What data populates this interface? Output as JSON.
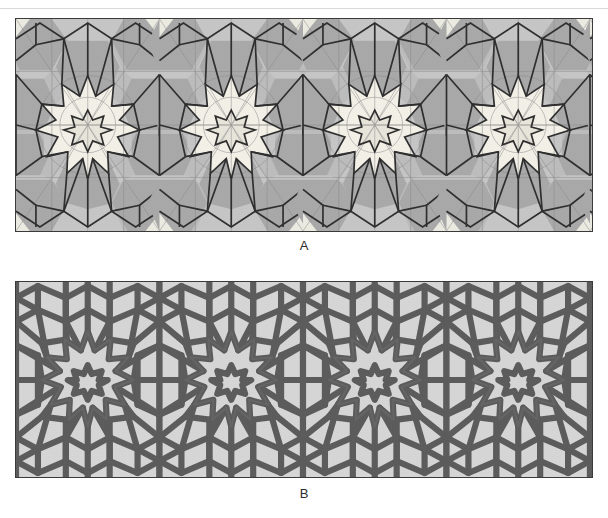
{
  "figure": {
    "background_color": "#ffffff",
    "top_cut_text": "",
    "panels": [
      {
        "id": "A",
        "label": "A",
        "caption": "A",
        "description": "Underlying polygonal tiling with construction lines and thin strapwork overlay",
        "background_color": "#bdbdbd",
        "tile_dark_color": "#a9a9a9",
        "tile_mid_color": "#c4c4c4",
        "tile_light_color": "#ececec",
        "star_color": "#f0efe8",
        "line_color": "#333333",
        "thin_line_color": "#7d7d7d",
        "border_color": "#3a3a3a",
        "symmetry": "12-fold rosettes",
        "repeat_count": 2,
        "x": 15,
        "y": 18,
        "width": 578,
        "height": 214
      },
      {
        "id": "B",
        "label": "B",
        "caption": "B",
        "description": "Interlaced strapwork rendering of the same pattern",
        "background_color": "#d6d6d6",
        "strap_color": "#5c5c5c",
        "strap_edge_color": "#414141",
        "border_color": "#3a3a3a",
        "symmetry": "12-fold rosettes",
        "repeat_count": 2,
        "x": 15,
        "y": 281,
        "width": 578,
        "height": 197
      }
    ]
  },
  "colors": {
    "page_background": "#ffffff",
    "panel_a_base": "#bdbdbd",
    "panel_b_base": "#d6d6d6",
    "dark_line": "#333333",
    "strap": "#5c5c5c",
    "label_text": "#2b2b2b"
  }
}
